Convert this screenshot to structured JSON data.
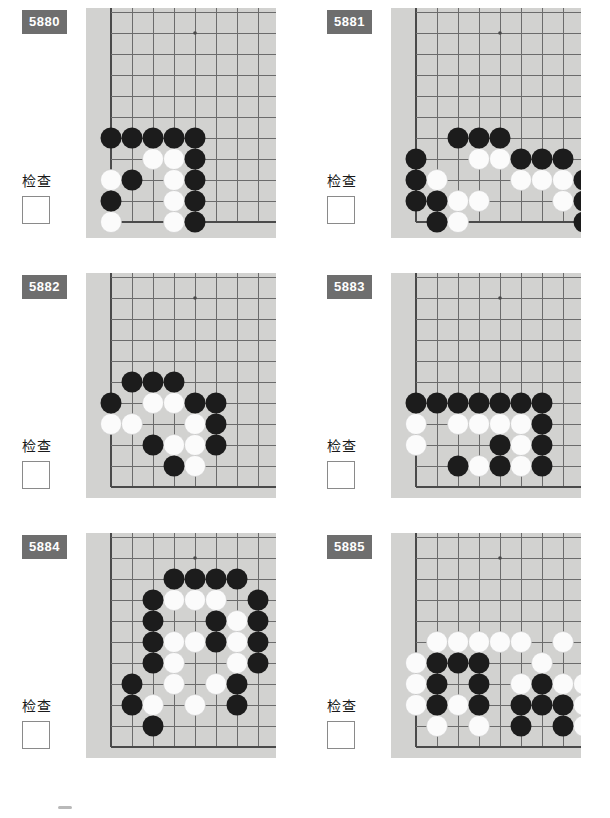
{
  "worksheet": {
    "check_label": "检查",
    "badge_color": "#6e6e6e",
    "board_color": "#d2d2d0",
    "line_color": "#6b6b6b",
    "black_color": "#1c1c1c",
    "white_color": "#fbfbfb"
  },
  "board_geometry": {
    "cols": 10,
    "rows": 11,
    "cell": 21,
    "stone_radius": 10.5,
    "note": "partial corner of a go board; x index 0 = left board edge, y index increases downward"
  },
  "problems": [
    {
      "number": "5880",
      "check_label": "检查",
      "board": {
        "width": 190,
        "height": 230,
        "left_edge_x": 1,
        "bottom_edge_y": 10,
        "star_points": [
          [
            5,
            1
          ]
        ],
        "black_stones": [
          [
            1,
            6
          ],
          [
            2,
            6
          ],
          [
            3,
            6
          ],
          [
            4,
            6
          ],
          [
            5,
            6
          ],
          [
            5,
            7
          ],
          [
            2,
            8
          ],
          [
            5,
            8
          ],
          [
            1,
            9
          ],
          [
            5,
            9
          ],
          [
            5,
            10
          ]
        ],
        "white_stones": [
          [
            3,
            7
          ],
          [
            4,
            7
          ],
          [
            1,
            8
          ],
          [
            4,
            8
          ],
          [
            4,
            9
          ],
          [
            1,
            10
          ],
          [
            4,
            10
          ]
        ]
      }
    },
    {
      "number": "5881",
      "check_label": "检查",
      "board": {
        "width": 190,
        "height": 230,
        "left_edge_x": 1,
        "bottom_edge_y": 10,
        "star_points": [
          [
            5,
            1
          ],
          [
            9,
            1
          ],
          [
            9,
            7
          ]
        ],
        "black_stones": [
          [
            3,
            6
          ],
          [
            4,
            6
          ],
          [
            5,
            6
          ],
          [
            1,
            7
          ],
          [
            6,
            7
          ],
          [
            7,
            7
          ],
          [
            8,
            7
          ],
          [
            1,
            8
          ],
          [
            9,
            8
          ],
          [
            1,
            9
          ],
          [
            2,
            9
          ],
          [
            9,
            9
          ],
          [
            2,
            10
          ],
          [
            9,
            10
          ]
        ],
        "white_stones": [
          [
            4,
            7
          ],
          [
            5,
            7
          ],
          [
            2,
            8
          ],
          [
            6,
            8
          ],
          [
            7,
            8
          ],
          [
            8,
            8
          ],
          [
            3,
            9
          ],
          [
            4,
            9
          ],
          [
            8,
            9
          ],
          [
            3,
            10
          ]
        ]
      }
    },
    {
      "number": "5882",
      "check_label": "检查",
      "board": {
        "width": 190,
        "height": 225,
        "left_edge_x": 1,
        "bottom_edge_y": 10,
        "star_points": [
          [
            5,
            1
          ],
          [
            9,
            1
          ],
          [
            9,
            6
          ]
        ],
        "black_stones": [
          [
            2,
            5
          ],
          [
            3,
            5
          ],
          [
            4,
            5
          ],
          [
            1,
            6
          ],
          [
            5,
            6
          ],
          [
            6,
            6
          ],
          [
            6,
            7
          ],
          [
            3,
            8
          ],
          [
            6,
            8
          ],
          [
            4,
            9
          ]
        ],
        "white_stones": [
          [
            3,
            6
          ],
          [
            4,
            6
          ],
          [
            1,
            7
          ],
          [
            2,
            7
          ],
          [
            5,
            7
          ],
          [
            4,
            8
          ],
          [
            5,
            8
          ],
          [
            5,
            9
          ]
        ]
      }
    },
    {
      "number": "5883",
      "check_label": "检查",
      "board": {
        "width": 190,
        "height": 225,
        "left_edge_x": 1,
        "bottom_edge_y": 10,
        "star_points": [
          [
            5,
            1
          ],
          [
            9,
            1
          ],
          [
            9,
            6
          ]
        ],
        "black_stones": [
          [
            1,
            6
          ],
          [
            2,
            6
          ],
          [
            3,
            6
          ],
          [
            4,
            6
          ],
          [
            5,
            6
          ],
          [
            6,
            6
          ],
          [
            7,
            6
          ],
          [
            7,
            7
          ],
          [
            5,
            8
          ],
          [
            7,
            8
          ],
          [
            3,
            9
          ],
          [
            5,
            9
          ],
          [
            7,
            9
          ]
        ],
        "white_stones": [
          [
            1,
            7
          ],
          [
            3,
            7
          ],
          [
            4,
            7
          ],
          [
            5,
            7
          ],
          [
            6,
            7
          ],
          [
            1,
            8
          ],
          [
            6,
            8
          ],
          [
            4,
            9
          ],
          [
            6,
            9
          ]
        ]
      }
    },
    {
      "number": "5884",
      "check_label": "检查",
      "board": {
        "width": 190,
        "height": 225,
        "left_edge_x": 1,
        "bottom_edge_y": 10,
        "star_points": [
          [
            5,
            1
          ],
          [
            9,
            1
          ],
          [
            9,
            7
          ]
        ],
        "black_stones": [
          [
            4,
            2
          ],
          [
            5,
            2
          ],
          [
            6,
            2
          ],
          [
            7,
            2
          ],
          [
            3,
            3
          ],
          [
            8,
            3
          ],
          [
            3,
            4
          ],
          [
            6,
            4
          ],
          [
            8,
            4
          ],
          [
            3,
            5
          ],
          [
            6,
            5
          ],
          [
            8,
            5
          ],
          [
            3,
            6
          ],
          [
            8,
            6
          ],
          [
            2,
            7
          ],
          [
            7,
            7
          ],
          [
            10,
            7
          ],
          [
            2,
            8
          ],
          [
            7,
            8
          ],
          [
            3,
            9
          ]
        ],
        "white_stones": [
          [
            4,
            3
          ],
          [
            5,
            3
          ],
          [
            6,
            3
          ],
          [
            7,
            4
          ],
          [
            4,
            5
          ],
          [
            5,
            5
          ],
          [
            7,
            5
          ],
          [
            4,
            6
          ],
          [
            7,
            6
          ],
          [
            4,
            7
          ],
          [
            6,
            7
          ],
          [
            3,
            8
          ],
          [
            5,
            8
          ]
        ]
      }
    },
    {
      "number": "5885",
      "check_label": "检查",
      "board": {
        "width": 190,
        "height": 225,
        "left_edge_x": 1,
        "bottom_edge_y": 10,
        "star_points": [
          [
            5,
            1
          ],
          [
            9,
            1
          ],
          [
            9,
            6
          ]
        ],
        "black_stones": [
          [
            2,
            6
          ],
          [
            3,
            6
          ],
          [
            4,
            6
          ],
          [
            2,
            7
          ],
          [
            4,
            7
          ],
          [
            7,
            7
          ],
          [
            2,
            8
          ],
          [
            4,
            8
          ],
          [
            6,
            8
          ],
          [
            7,
            8
          ],
          [
            8,
            8
          ],
          [
            6,
            9
          ],
          [
            8,
            9
          ]
        ],
        "white_stones": [
          [
            2,
            5
          ],
          [
            3,
            5
          ],
          [
            4,
            5
          ],
          [
            5,
            5
          ],
          [
            6,
            5
          ],
          [
            8,
            5
          ],
          [
            1,
            6
          ],
          [
            7,
            6
          ],
          [
            1,
            7
          ],
          [
            6,
            7
          ],
          [
            8,
            7
          ],
          [
            9,
            7
          ],
          [
            1,
            8
          ],
          [
            3,
            8
          ],
          [
            9,
            8
          ],
          [
            2,
            9
          ],
          [
            4,
            9
          ],
          [
            9,
            9
          ]
        ]
      }
    }
  ]
}
